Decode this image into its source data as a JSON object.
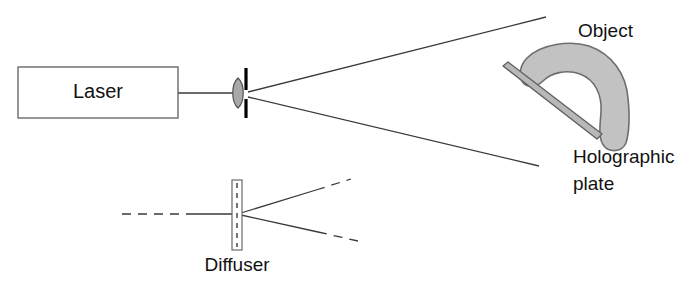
{
  "diagram": {
    "background_color": "#ffffff",
    "line_color": "#3a3a3a",
    "text_color": "#111111",
    "object_fill_color": "#c2c2c2",
    "object_stroke_color": "#6e6e6e",
    "plate_fill_color": "#b8b8b8",
    "plate_stroke_color": "#5e5e5e",
    "lens_fill_color": "#a8a8a8",
    "aperture_color": "#000000",
    "labels": {
      "laser": "Laser",
      "object": "Object",
      "holographic_plate_line1": "Holographic",
      "holographic_plate_line2": "plate",
      "diffuser": "Diffuser"
    },
    "components": [
      {
        "name": "laser-source-box",
        "label": "Laser",
        "shape": "rectangle",
        "x": 18,
        "y": 67,
        "width": 160,
        "height": 51
      },
      {
        "name": "lens",
        "label": "",
        "shape": "biconvex-lens",
        "cx": 238,
        "cy": 93,
        "rx": 6,
        "ry": 15
      },
      {
        "name": "aperture-pinhole",
        "label": "",
        "shape": "vertical-bar",
        "x": 246,
        "y_top": 68,
        "y_bottom": 118
      },
      {
        "name": "object",
        "label": "Object",
        "shape": "hook-blob"
      },
      {
        "name": "holographic-plate",
        "label": "Holographic plate",
        "shape": "thin-diagonal-bar",
        "x1": 505,
        "y1": 69,
        "x2": 599,
        "y2": 139
      },
      {
        "name": "diffuser",
        "label": "Diffuser",
        "shape": "thin-vertical-plate",
        "x": 232,
        "y": 180,
        "width": 10,
        "height": 70
      }
    ],
    "beams": [
      {
        "name": "laser-to-lens-beam",
        "style": "solid",
        "x1": 178,
        "y1": 93,
        "x2": 234,
        "y2": 93
      },
      {
        "name": "upper-diverging-ray",
        "style": "solid",
        "x1": 248,
        "y1": 92,
        "x2": 546,
        "y2": 17
      },
      {
        "name": "lower-diverging-ray",
        "style": "solid",
        "x1": 248,
        "y1": 97,
        "x2": 539,
        "y2": 166
      },
      {
        "name": "diffuser-input-ray-dashed",
        "style": "dashed",
        "x1": 122,
        "y1": 214,
        "x2": 190,
        "y2": 214
      },
      {
        "name": "diffuser-input-ray-solid",
        "style": "solid",
        "x1": 190,
        "y1": 214,
        "x2": 234,
        "y2": 214
      },
      {
        "name": "diffuser-output-upper-solid",
        "style": "solid",
        "x1": 241,
        "y1": 213,
        "x2": 316,
        "y2": 190
      },
      {
        "name": "diffuser-output-upper-dashed",
        "style": "dashed",
        "x1": 316,
        "y1": 190,
        "x2": 351,
        "y2": 179
      },
      {
        "name": "diffuser-output-lower-solid",
        "style": "solid",
        "x1": 241,
        "y1": 215,
        "x2": 318,
        "y2": 232
      },
      {
        "name": "diffuser-output-lower-dashed",
        "style": "dashed",
        "x1": 318,
        "y1": 232,
        "x2": 358,
        "y2": 241
      }
    ]
  }
}
